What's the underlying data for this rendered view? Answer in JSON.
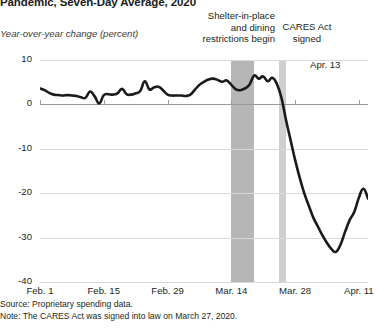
{
  "chart_data": {
    "type": "line",
    "title": "Pandemic, Seven-Day Average, 2020",
    "subtitle": "",
    "ylabel": "Year-over-year change (percent)",
    "xlabel": "",
    "ylim": [
      -40,
      10
    ],
    "y_ticks": [
      "10",
      "0",
      "-10",
      "-20",
      "-30",
      "-40"
    ],
    "y_tick_values": [
      10,
      0,
      -10,
      -20,
      -30,
      -40
    ],
    "x_ticks": [
      "Feb. 1",
      "Feb. 15",
      "Feb. 29",
      "Mar. 14",
      "Mar. 28",
      "Apr. 11"
    ],
    "x_tick_values": [
      0,
      14,
      28,
      42,
      56,
      70
    ],
    "xlim": [
      0,
      72
    ],
    "grid": "horizontal",
    "legend": "none",
    "series": [
      {
        "name": "Year-over-year change (percent)",
        "color": "#1a1a1a",
        "x": [
          0,
          1,
          2,
          3,
          4,
          5,
          6,
          7,
          8,
          9,
          10,
          11,
          12,
          13,
          14,
          15,
          16,
          17,
          18,
          19,
          20,
          21,
          22,
          23,
          24,
          25,
          26,
          27,
          28,
          29,
          30,
          31,
          32,
          33,
          34,
          35,
          36,
          37,
          38,
          39,
          40,
          41,
          42,
          43,
          44,
          45,
          46,
          47,
          48,
          49,
          50,
          51,
          52,
          53,
          54,
          55,
          56,
          57,
          58,
          59,
          60,
          61,
          62,
          63,
          64,
          65,
          66,
          67,
          68,
          69,
          70,
          71,
          72
        ],
        "values": [
          3.6,
          3.2,
          2.6,
          2.2,
          2.1,
          2.0,
          2.1,
          2.0,
          1.9,
          1.6,
          1.5,
          2.9,
          1.8,
          0.2,
          2.1,
          2.3,
          2.2,
          2.5,
          3.5,
          2.3,
          2.2,
          2.5,
          3.0,
          5.2,
          3.4,
          3.8,
          4.0,
          3.2,
          2.2,
          2.0,
          2.0,
          2.0,
          1.9,
          2.2,
          3.3,
          4.4,
          5.1,
          5.6,
          5.8,
          5.5,
          5.1,
          5.4,
          4.4,
          3.4,
          3.2,
          3.6,
          4.5,
          6.5,
          5.8,
          6.3,
          5.2,
          6.0,
          4.6,
          1.5,
          -3.5,
          -8.0,
          -12.5,
          -16.5,
          -20.0,
          -22.8,
          -25.5,
          -27.5,
          -29.5,
          -31.2,
          -32.6,
          -33.2,
          -31.5,
          -28.6,
          -26.0,
          -24.2,
          -21.0,
          -19.0,
          -21.2
        ]
      }
    ],
    "annotations": [
      {
        "name": "shelter-in-place-band",
        "label": "Shelter-in-place and dining restrictions begin",
        "x_start": 42,
        "x_end": 47,
        "color": "#b6b6b6"
      },
      {
        "name": "cares-act-band",
        "label": "CARES Act signed",
        "x_start": 52.5,
        "x_end": 54,
        "color": "#cfcfcf"
      },
      {
        "name": "end-point-label",
        "label": "Apr. 13",
        "x": 72,
        "y": -21.2
      }
    ]
  },
  "header": {
    "title": "Pandemic, Seven-Day Average, 2020",
    "axis_label": "Year-over-year change (percent)"
  },
  "annotations": {
    "shelter_line1": "Shelter-in-place",
    "shelter_line2": "and dining",
    "shelter_line3": "restrictions begin",
    "cares_line1": "CARES Act",
    "cares_line2": "signed",
    "end_label": "Apr. 13"
  },
  "footnotes": {
    "source": "Source: Proprietary spending data.",
    "note": "Note: The CARES Act was signed into law on March 27, 2020."
  }
}
